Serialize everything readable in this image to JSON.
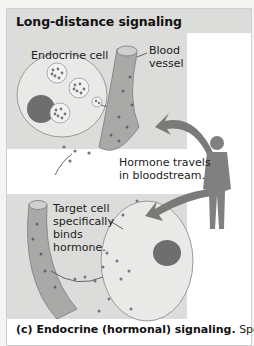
{
  "figure": {
    "title": "Long-distance signaling",
    "labels": {
      "endocrine_cell": "Endocrine cell",
      "blood_vessel_line1": "Blood",
      "blood_vessel_line2": "vessel",
      "hormone_travels_line1": "Hormone travels",
      "hormone_travels_line2": "in bloodstream.",
      "target_line1": "Target cell",
      "target_line2": "specifically",
      "target_line3": "binds",
      "target_line4": "hormone."
    },
    "caption": {
      "bold": "(c) Endocrine (hormonal) signaling.",
      "text": " Specialized"
    },
    "colors": {
      "panel": "#dcdcda",
      "cell_fill": "#e9e9e7",
      "nucleus": "#6e6e6e",
      "vessel": "#a9a9a7",
      "arrow": "#7a7a78",
      "human": "#808080"
    }
  }
}
